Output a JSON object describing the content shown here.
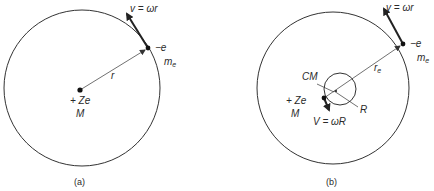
{
  "figure": {
    "panel_a": {
      "caption": "(a)",
      "orbit": {
        "cx": 82,
        "cy": 88,
        "r": 78
      },
      "nucleus": {
        "x": 80,
        "y": 90,
        "charge_label": "+ Ze",
        "mass_label": "M"
      },
      "electron": {
        "x": 148,
        "y": 48,
        "charge_label": "−e",
        "mass_label": "m",
        "mass_subscript": "e"
      },
      "radius_label": "r",
      "velocity_label": "v = ωr",
      "velocity_arrow": {
        "x1": 148,
        "y1": 48,
        "x2": 126,
        "y2": 12
      }
    },
    "panel_b": {
      "caption": "(b)",
      "orbit": {
        "cx": 333,
        "cy": 88,
        "r": 76
      },
      "cm_circle": {
        "cx": 340,
        "cy": 89,
        "r": 16
      },
      "nucleus": {
        "x": 324,
        "y": 98,
        "charge_label": "+ Ze",
        "mass_label": "M"
      },
      "electron": {
        "x": 403,
        "y": 44,
        "charge_label": "−e",
        "mass_label": "m",
        "mass_subscript": "e"
      },
      "cm_label": "CM",
      "radius_label": "r",
      "radius_subscript": "e",
      "small_radius_label": "R",
      "velocity_label": "v = ωr",
      "nucleus_velocity_label": "V = ωR",
      "velocity_arrow": {
        "x1": 403,
        "y1": 44,
        "x2": 383,
        "y2": 7
      },
      "nucleus_velocity_arrow": {
        "x1": 324,
        "y1": 98,
        "x2": 330,
        "y2": 111
      }
    },
    "colors": {
      "line": "#333333",
      "background": "#ffffff"
    }
  }
}
